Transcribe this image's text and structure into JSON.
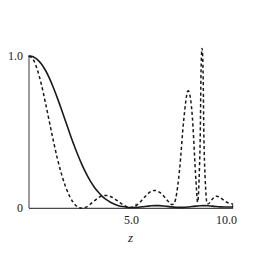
{
  "figure": {
    "background_color": "#ffffff",
    "ink_color": "#1a1a1a",
    "width": 255,
    "height": 253
  },
  "axes": {
    "x_title": "z",
    "x_ticks": [
      {
        "label": "5.0",
        "value": 5.0
      },
      {
        "label": "10.0",
        "value": 10.0
      }
    ],
    "y_ticks": [
      {
        "label": "1.0",
        "value": 1.0
      },
      {
        "label": "0",
        "value": 0.0
      }
    ],
    "y_title": ""
  },
  "chart_data": {
    "type": "line",
    "title": "",
    "subtitle": "",
    "xlabel": "z",
    "ylabel": "",
    "xlim": [
      0.0,
      10.0
    ],
    "ylim": [
      0.0,
      1.05
    ],
    "grid": false,
    "legend": "none",
    "clipped_above": true,
    "series": [
      {
        "name": "solid-curve",
        "style": "solid",
        "color": "#1a1a1a",
        "x": [
          0.0,
          0.2,
          0.4,
          0.6,
          0.8,
          1.0,
          1.2,
          1.4,
          1.6,
          1.8,
          2.0,
          2.2,
          2.4,
          2.6,
          2.8,
          3.0,
          3.2,
          3.4,
          3.6,
          3.8,
          4.0,
          4.2,
          4.4,
          4.6,
          4.8,
          5.0,
          5.2,
          5.4,
          5.6,
          5.8,
          6.0,
          6.2,
          6.4,
          6.6,
          6.8,
          7.0,
          7.2,
          7.4,
          7.6,
          7.8,
          8.0,
          8.2,
          8.4,
          8.6,
          8.8,
          9.0,
          9.2,
          9.4,
          9.6,
          9.8,
          10.0
        ],
        "y": [
          1.0,
          0.995,
          0.978,
          0.949,
          0.908,
          0.855,
          0.792,
          0.722,
          0.647,
          0.57,
          0.493,
          0.419,
          0.35,
          0.287,
          0.231,
          0.182,
          0.141,
          0.107,
          0.079,
          0.057,
          0.04,
          0.027,
          0.018,
          0.012,
          0.008,
          0.006,
          0.006,
          0.008,
          0.011,
          0.014,
          0.017,
          0.018,
          0.018,
          0.016,
          0.013,
          0.01,
          0.008,
          0.007,
          0.007,
          0.009,
          0.012,
          0.015,
          0.017,
          0.018,
          0.017,
          0.015,
          0.012,
          0.01,
          0.009,
          0.009,
          0.01
        ]
      },
      {
        "name": "dashed-curve",
        "style": "dashed",
        "color": "#1a1a1a",
        "x": [
          0.0,
          0.2,
          0.4,
          0.6,
          0.8,
          1.0,
          1.2,
          1.4,
          1.6,
          1.8,
          2.0,
          2.2,
          2.4,
          2.6,
          2.8,
          3.0,
          3.2,
          3.4,
          3.6,
          3.8,
          4.0,
          4.2,
          4.4,
          4.6,
          4.8,
          5.0,
          5.2,
          5.4,
          5.6,
          5.8,
          6.0,
          6.2,
          6.4,
          6.6,
          6.8,
          7.0,
          7.2,
          7.4,
          7.6,
          7.8,
          8.0,
          8.2,
          8.3,
          8.4,
          8.45,
          8.5,
          8.55,
          8.6,
          8.7,
          8.8,
          9.0,
          9.2,
          9.4,
          9.6,
          9.8,
          10.0
        ],
        "y": [
          1.0,
          0.978,
          0.915,
          0.818,
          0.698,
          0.569,
          0.441,
          0.324,
          0.223,
          0.141,
          0.078,
          0.034,
          0.009,
          0.001,
          0.008,
          0.026,
          0.048,
          0.069,
          0.082,
          0.085,
          0.078,
          0.063,
          0.044,
          0.025,
          0.011,
          0.006,
          0.014,
          0.034,
          0.062,
          0.091,
          0.112,
          0.118,
          0.107,
          0.083,
          0.052,
          0.026,
          0.06,
          0.26,
          0.58,
          0.77,
          0.64,
          0.18,
          0.05,
          0.4,
          0.9,
          1.05,
          0.9,
          0.4,
          0.08,
          0.03,
          0.06,
          0.08,
          0.07,
          0.05,
          0.035,
          0.03
        ]
      }
    ]
  }
}
